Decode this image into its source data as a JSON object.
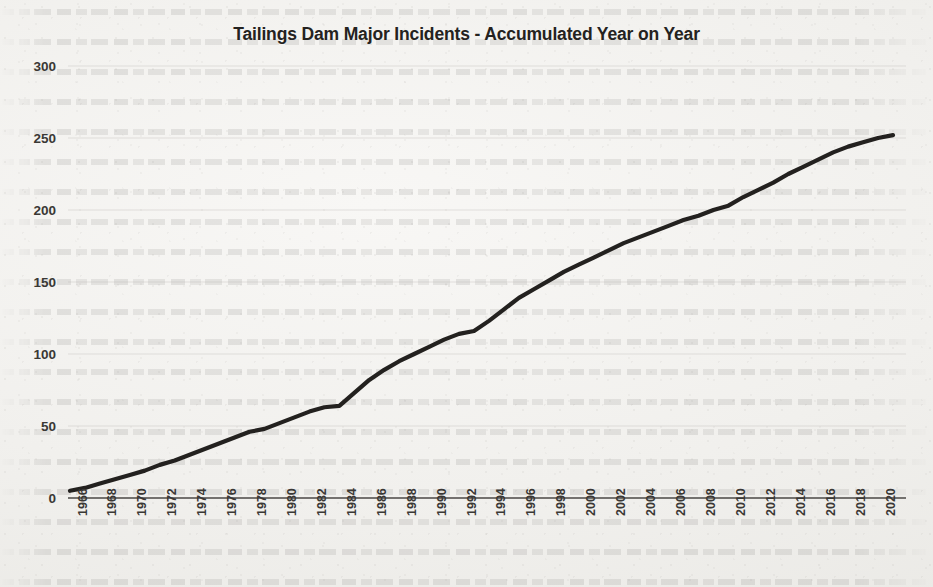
{
  "chart_data": {
    "type": "line",
    "title": "Tailings Dam Major Incidents - Accumulated Year on Year",
    "xlabel": "",
    "ylabel": "",
    "xlim": [
      1966,
      2021
    ],
    "ylim": [
      0,
      300
    ],
    "ytick_labels": [
      "300",
      "250",
      "200",
      "150",
      "100",
      "50",
      "0"
    ],
    "ytick_values": [
      300,
      250,
      200,
      150,
      100,
      50,
      0
    ],
    "xtick_labels": [
      "1966",
      "1968",
      "1970",
      "1972",
      "1974",
      "1976",
      "1978",
      "1980",
      "1982",
      "1984",
      "1986",
      "1988",
      "1990",
      "1992",
      "1994",
      "1996",
      "1998",
      "2000",
      "2002",
      "2004",
      "2006",
      "2008",
      "2010",
      "2012",
      "2014",
      "2016",
      "2018",
      "2020"
    ],
    "xtick_values": [
      1966,
      1968,
      1970,
      1972,
      1974,
      1976,
      1978,
      1980,
      1982,
      1984,
      1986,
      1988,
      1990,
      1992,
      1994,
      1996,
      1998,
      2000,
      2002,
      2004,
      2006,
      2008,
      2010,
      2012,
      2014,
      2016,
      2018,
      2020
    ],
    "grid": true,
    "legend": "none",
    "line_color": "#23211f",
    "series": [
      {
        "name": "Accumulated major tailings dam incidents",
        "x": [
          1966,
          1967,
          1968,
          1969,
          1970,
          1971,
          1972,
          1973,
          1974,
          1975,
          1976,
          1977,
          1978,
          1979,
          1980,
          1981,
          1982,
          1983,
          1984,
          1985,
          1986,
          1987,
          1988,
          1989,
          1990,
          1991,
          1992,
          1993,
          1994,
          1995,
          1996,
          1997,
          1998,
          1999,
          2000,
          2001,
          2002,
          2003,
          2004,
          2005,
          2006,
          2007,
          2008,
          2009,
          2010,
          2011,
          2012,
          2013,
          2014,
          2015,
          2016,
          2017,
          2018,
          2019,
          2020,
          2021
        ],
        "values": [
          5,
          7,
          10,
          13,
          16,
          19,
          23,
          26,
          30,
          34,
          38,
          42,
          46,
          48,
          52,
          56,
          60,
          63,
          64,
          73,
          82,
          89,
          95,
          100,
          105,
          110,
          114,
          116,
          123,
          131,
          139,
          145,
          151,
          157,
          162,
          167,
          172,
          177,
          181,
          185,
          189,
          193,
          196,
          200,
          203,
          209,
          214,
          219,
          225,
          230,
          235,
          240,
          244,
          247,
          250,
          252
        ]
      }
    ]
  },
  "axes_geometry": {
    "plot_left": 68,
    "plot_right": 906,
    "y_top_px": 66,
    "y_bottom_px": 498,
    "x_first_px": 70,
    "x_last_px": 893
  }
}
